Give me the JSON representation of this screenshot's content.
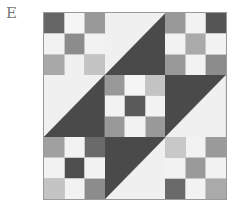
{
  "label": "E",
  "colors": {
    "triangle_dark": "#4a4a4a",
    "triangle_light": "#f0f0f0",
    "seam": "#c8c8c8"
  },
  "block": {
    "layout": "3x3 grid of 9 cells: five nine-patches (corners and center) and four half-square triangles",
    "cells": [
      {
        "position": "top-left",
        "type": "nine-patch",
        "squares": [
          "#666666",
          "#f5f5f5",
          "#999999",
          "#f2f2f2",
          "#8c8c8c",
          "#f2f2f2",
          "#a8a8a8",
          "#f0f0f0",
          "#c4c4c4"
        ]
      },
      {
        "position": "top-middle",
        "type": "half-square-triangle",
        "diagonal": "bottom-left to top-right",
        "upper_left": "light",
        "lower_right": "dark"
      },
      {
        "position": "top-right",
        "type": "nine-patch",
        "squares": [
          "#999999",
          "#f2f2f2",
          "#555555",
          "#f2f2f2",
          "#aaaaaa",
          "#f2f2f2",
          "#999999",
          "#f2f2f2",
          "#8c8c8c"
        ]
      },
      {
        "position": "middle-left",
        "type": "half-square-triangle",
        "diagonal": "bottom-left to top-right",
        "upper_left": "light",
        "lower_right": "dark"
      },
      {
        "position": "center",
        "type": "nine-patch",
        "squares": [
          "#999999",
          "#f5f5f5",
          "#c4c4c4",
          "#f2f2f2",
          "#5a5a5a",
          "#f2f2f2",
          "#999999",
          "#f2f2f2",
          "#999999"
        ]
      },
      {
        "position": "middle-right",
        "type": "half-square-triangle",
        "diagonal": "bottom-left to top-right",
        "upper_left": "dark",
        "lower_right": "light"
      },
      {
        "position": "bottom-left",
        "type": "nine-patch",
        "squares": [
          "#a0a0a0",
          "#f2f2f2",
          "#6a6a6a",
          "#f2f2f2",
          "#4e4e4e",
          "#f2f2f2",
          "#c4c4c4",
          "#f2f2f2",
          "#8c8c8c"
        ]
      },
      {
        "position": "bottom-middle",
        "type": "half-square-triangle",
        "diagonal": "bottom-left to top-right",
        "upper_left": "dark",
        "lower_right": "light"
      },
      {
        "position": "bottom-right",
        "type": "nine-patch",
        "squares": [
          "#c8c8c8",
          "#f2f2f2",
          "#9a9a9a",
          "#f2f2f2",
          "#9a9a9a",
          "#f2f2f2",
          "#6a6a6a",
          "#f2f2f2",
          "#aaaaaa"
        ]
      }
    ]
  }
}
